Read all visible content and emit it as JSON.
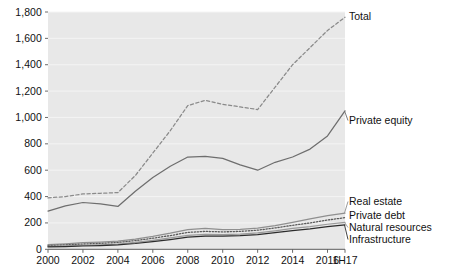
{
  "chart_data": {
    "type": "line",
    "title": "",
    "subtitle": "",
    "xlabel": "",
    "ylabel": "",
    "grid": true,
    "legend_position": "right-inline-labels",
    "x": [
      "2000",
      "2001",
      "2002",
      "2003",
      "2004",
      "2005",
      "2006",
      "2007",
      "2008",
      "2009",
      "2010",
      "2011",
      "2012",
      "2013",
      "2014",
      "2015",
      "2016",
      "1H17"
    ],
    "xtick_labels": [
      "2000",
      "2002",
      "2004",
      "2006",
      "2008",
      "2010",
      "2012",
      "2014",
      "2016",
      "1H17"
    ],
    "ytick_labels": [
      "0",
      "200",
      "400",
      "600",
      "800",
      "1,000",
      "1,200",
      "1,400",
      "1,600",
      "1,800"
    ],
    "ylim": [
      0,
      1800
    ],
    "xlim_index": [
      0,
      17
    ],
    "series": [
      {
        "name": "Total",
        "style": "dashed",
        "color": "#8a8a8a",
        "values": [
          390,
          400,
          420,
          425,
          430,
          560,
          730,
          900,
          1090,
          1130,
          1100,
          1080,
          1060,
          1230,
          1400,
          1530,
          1660,
          1760
        ]
      },
      {
        "name": "Private equity",
        "style": "solid",
        "color": "#6e6e6e",
        "values": [
          290,
          330,
          355,
          345,
          325,
          440,
          545,
          630,
          700,
          705,
          690,
          640,
          600,
          660,
          700,
          760,
          860,
          1050
        ]
      },
      {
        "name": "Real estate",
        "style": "solid",
        "color": "#8f8f8f",
        "values": [
          35,
          42,
          50,
          55,
          62,
          78,
          98,
          122,
          150,
          158,
          150,
          152,
          160,
          180,
          205,
          230,
          255,
          275
        ]
      },
      {
        "name": "Private debt",
        "style": "dotted",
        "color": "#5a5a5a",
        "values": [
          28,
          34,
          40,
          45,
          52,
          66,
          84,
          104,
          128,
          136,
          132,
          136,
          145,
          162,
          182,
          200,
          222,
          240
        ]
      },
      {
        "name": "Natural resources",
        "style": "solid",
        "color": "#9a9a9a",
        "values": [
          22,
          26,
          30,
          34,
          40,
          52,
          68,
          86,
          106,
          114,
          112,
          116,
          124,
          140,
          158,
          172,
          190,
          205
        ]
      },
      {
        "name": "Infrastructure",
        "style": "solid",
        "color": "#2c2c2c",
        "values": [
          18,
          21,
          25,
          28,
          33,
          44,
          58,
          74,
          92,
          100,
          100,
          104,
          112,
          126,
          142,
          155,
          172,
          185
        ]
      }
    ],
    "annotations": [
      {
        "text": "Total",
        "series": "Total"
      },
      {
        "text": "Private equity",
        "series": "Private equity"
      },
      {
        "text": "Real estate",
        "series": "Real estate"
      },
      {
        "text": "Private debt",
        "series": "Private debt"
      },
      {
        "text": "Natural resources",
        "series": "Natural resources"
      },
      {
        "text": "Infrastructure",
        "series": "Infrastructure"
      }
    ],
    "colors": {
      "plot_background": "#e8e8e8",
      "gridline": "#f4f4f4",
      "axis": "#6a6a6a",
      "text": "#111111"
    }
  }
}
